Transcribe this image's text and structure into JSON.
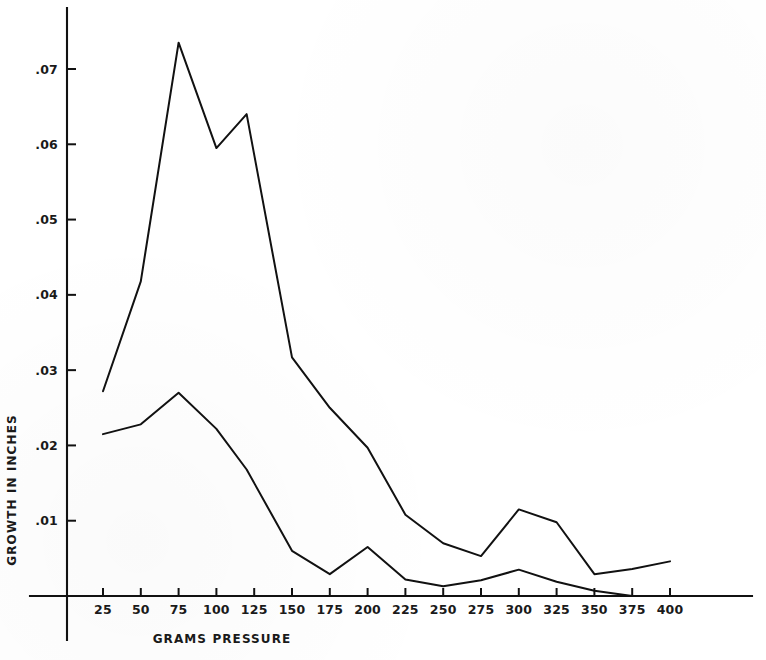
{
  "chart_data": {
    "type": "line",
    "title": "",
    "subtitle": "",
    "xlabel": "GRAMS PRESSURE",
    "ylabel": "GROWTH IN INCHES",
    "xlim": [
      0,
      412
    ],
    "ylim": [
      0,
      0.0775
    ],
    "grid": false,
    "legend": "none",
    "x_ticks": [
      25,
      50,
      75,
      100,
      125,
      150,
      175,
      200,
      225,
      250,
      275,
      300,
      325,
      350,
      375,
      400
    ],
    "x_tick_labels": [
      "25",
      "50",
      "75",
      "100",
      "125",
      "150",
      "175",
      "200",
      "225",
      "250",
      "275",
      "300",
      "325",
      "350",
      "375",
      "400"
    ],
    "y_ticks": [
      0.01,
      0.02,
      0.03,
      0.04,
      0.05,
      0.06,
      0.07
    ],
    "y_tick_labels": [
      ".01",
      ".02",
      ".03",
      ".04",
      ".05",
      ".06",
      ".07"
    ],
    "x": [
      25,
      50,
      75,
      100,
      120,
      150,
      175,
      200,
      225,
      250,
      275,
      300,
      325,
      350,
      375,
      400
    ],
    "series": [
      {
        "name": "upper-curve",
        "values": [
          0.0272,
          0.0418,
          0.0735,
          0.0595,
          0.064,
          0.0317,
          0.025,
          0.0197,
          0.0108,
          0.007,
          0.0053,
          0.0115,
          0.0098,
          0.0029,
          0.0036,
          0.0046
        ]
      },
      {
        "name": "lower-curve",
        "values": [
          0.0215,
          0.0228,
          0.027,
          0.0222,
          0.0168,
          0.006,
          0.0029,
          0.0065,
          0.0022,
          0.0013,
          0.0021,
          0.0035,
          0.0019,
          0.0007,
          0.0,
          0.0
        ]
      }
    ],
    "annotations": []
  },
  "figure": {
    "background_color": "#ffffff",
    "line_color": "#111111",
    "text_color": "#1a1a1a"
  }
}
